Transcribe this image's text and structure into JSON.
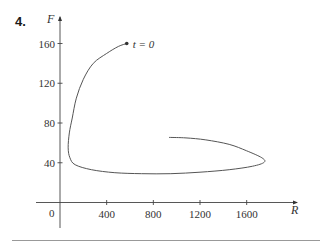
{
  "problem_number": "4.",
  "chart_data": {
    "type": "line",
    "subtype": "parametric",
    "title": "",
    "xlabel": "R",
    "ylabel": "F",
    "origin_label": "0",
    "xlim": [
      0,
      2030
    ],
    "ylim": [
      -22,
      185
    ],
    "x_ticks": [
      400,
      800,
      1200,
      1600
    ],
    "x_tick_labels": [
      "400",
      "800",
      "1200",
      "1600"
    ],
    "y_ticks": [
      40,
      80,
      120,
      160
    ],
    "y_tick_labels": [
      "40",
      "80",
      "120",
      "160"
    ],
    "grid": false,
    "legend": null,
    "annotations": [
      {
        "text": "t = 0",
        "x": 572,
        "y": 160,
        "marker": "dot"
      }
    ],
    "series": [
      {
        "name": "(R(t), F(t))",
        "color": "#555555",
        "points": [
          [
            572,
            160
          ],
          [
            500,
            157
          ],
          [
            400,
            150
          ],
          [
            285,
            140
          ],
          [
            200,
            124
          ],
          [
            140,
            105
          ],
          [
            105,
            85
          ],
          [
            80,
            70
          ],
          [
            70,
            55
          ],
          [
            85,
            45
          ],
          [
            130,
            38
          ],
          [
            270,
            33
          ],
          [
            470,
            30
          ],
          [
            700,
            29
          ],
          [
            950,
            29
          ],
          [
            1200,
            30.5
          ],
          [
            1450,
            33
          ],
          [
            1650,
            36.5
          ],
          [
            1750,
            40.5
          ],
          [
            1730,
            45
          ],
          [
            1600,
            52
          ],
          [
            1450,
            58.5
          ],
          [
            1250,
            63
          ],
          [
            1080,
            65
          ],
          [
            935,
            65.5
          ]
        ]
      }
    ]
  },
  "colors": {
    "axis": "#444444",
    "curve": "#666666",
    "text": "#333333",
    "rule": "#999999"
  }
}
